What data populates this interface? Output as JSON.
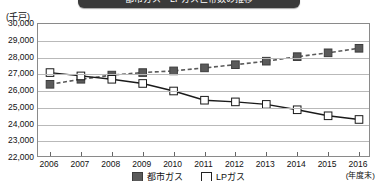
{
  "title": {
    "text": "都市ガス・LPガス世帯数の推移"
  },
  "axis": {
    "unit_label": "(千戸)",
    "x_note": "(年度末)"
  },
  "legend": {
    "items": [
      {
        "key": "city-gas-key",
        "label": "都市ガス"
      },
      {
        "key": "lp-gas-key",
        "label": "LPガス"
      }
    ]
  },
  "colors": {
    "city_gas": "#5a5a5a",
    "lp_gas": "#1a1a1a",
    "grid": "#b9b9b9",
    "frame": "#8a8a8a",
    "title_bar": "#3a3a3a"
  },
  "chart_data": {
    "type": "line",
    "title": "都市ガス・LPガス世帯数の推移",
    "xlabel": "(年度末)",
    "ylabel": "(千戸)",
    "ylim": [
      22000,
      30000
    ],
    "ytick_step": 1000,
    "yticks": [
      "30,000",
      "29,000",
      "28,000",
      "27,000",
      "26,000",
      "25,000",
      "24,000",
      "23,000",
      "22,000"
    ],
    "ytick_values": [
      30000,
      29000,
      28000,
      27000,
      26000,
      25000,
      24000,
      23000,
      22000
    ],
    "grid": true,
    "legend_position": "bottom",
    "categories": [
      "2006",
      "2007",
      "2008",
      "2009",
      "2010",
      "2011",
      "2012",
      "2013",
      "2014",
      "2015",
      "2016"
    ],
    "series": [
      {
        "name": "都市ガス",
        "style": "dashed",
        "marker": "filled-square",
        "color": "#5a5a5a",
        "values": [
          26400,
          26700,
          26950,
          27100,
          27200,
          27380,
          27570,
          27780,
          28050,
          28280,
          28550
        ]
      },
      {
        "name": "LPガス",
        "style": "solid",
        "marker": "open-square",
        "color": "#1a1a1a",
        "values": [
          27100,
          26900,
          26700,
          26450,
          26000,
          25450,
          25350,
          25200,
          24880,
          24520,
          24300
        ]
      }
    ]
  }
}
